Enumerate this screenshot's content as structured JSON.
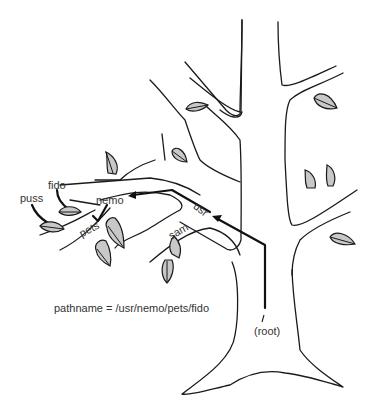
{
  "diagram": {
    "labels": {
      "puss": "puss",
      "fido": "fido",
      "nemo": "nemo",
      "pets": "pets",
      "usr": "usr",
      "sam": "sam",
      "root": "(root)"
    },
    "pathname_caption": "pathname = /usr/nemo/pets/fido",
    "colors": {
      "outline": "#1a1a1a",
      "leaf_fill": "#c8c8c8",
      "text": "#333333",
      "background": "#ffffff"
    }
  }
}
